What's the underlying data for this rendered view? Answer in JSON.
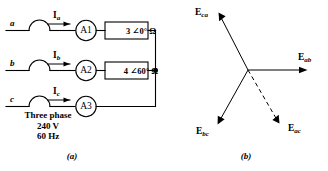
{
  "figure": {
    "panel_a": {
      "caption": "(a)",
      "phases": [
        {
          "letter": "a",
          "current_main": "I",
          "current_sub": "a",
          "meter": "A1"
        },
        {
          "letter": "b",
          "current_main": "I",
          "current_sub": "b",
          "meter": "A2"
        },
        {
          "letter": "c",
          "current_main": "I",
          "current_sub": "c",
          "meter": "A3"
        }
      ],
      "impedances": [
        {
          "text": "3 ∠0° Ω"
        },
        {
          "text": "4 ∠60° Ω"
        }
      ],
      "source": {
        "line1": "Three phase",
        "line2": "240 V",
        "line3": "60 Hz"
      }
    },
    "panel_b": {
      "caption": "(b)",
      "vectors": [
        {
          "main": "E",
          "sub": "ca",
          "style": "solid"
        },
        {
          "main": "E",
          "sub": "ab",
          "style": "solid"
        },
        {
          "main": "E",
          "sub": "bc",
          "style": "solid"
        },
        {
          "main": "E",
          "sub": "ac",
          "style": "dashed"
        }
      ]
    },
    "colors": {
      "ink": "#000000",
      "background": "#ffffff"
    }
  }
}
